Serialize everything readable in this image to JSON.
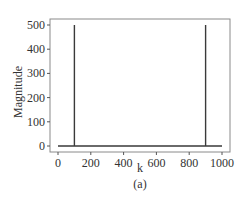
{
  "chart_data": {
    "type": "line",
    "title": "",
    "caption": "(a)",
    "xlabel": "k",
    "ylabel": "Magnitude",
    "xlim": [
      0,
      1000
    ],
    "ylim": [
      0,
      500
    ],
    "grid": false,
    "xticks": [
      0,
      200,
      400,
      600,
      800,
      1000
    ],
    "yticks": [
      0,
      100,
      200,
      300,
      400,
      500
    ],
    "series": [
      {
        "name": "magnitude",
        "x": [
          0,
          100,
          100,
          100,
          900,
          900,
          900,
          1000
        ],
        "y": [
          0,
          0,
          500,
          0,
          0,
          500,
          0,
          0
        ]
      }
    ],
    "annotations": []
  }
}
